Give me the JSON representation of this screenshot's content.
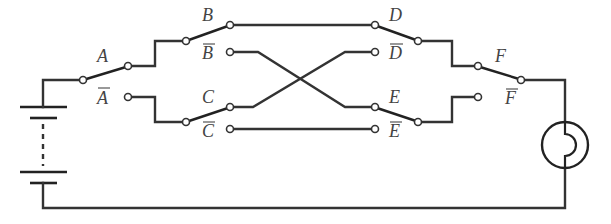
{
  "diagram": {
    "type": "switching circuit",
    "switches": [
      {
        "id": "A",
        "label": "A",
        "complement_label": "A"
      },
      {
        "id": "B",
        "label": "B",
        "complement_label": "B"
      },
      {
        "id": "C",
        "label": "C",
        "complement_label": "C"
      },
      {
        "id": "D",
        "label": "D",
        "complement_label": "D"
      },
      {
        "id": "E",
        "label": "E",
        "complement_label": "E"
      },
      {
        "id": "F",
        "label": "F",
        "complement_label": "F"
      }
    ],
    "components": {
      "battery": "battery-multi-cell",
      "lamp": "lamp"
    },
    "colors": {
      "wire": "#333333",
      "label": "#444444",
      "background": "#ffffff"
    }
  }
}
